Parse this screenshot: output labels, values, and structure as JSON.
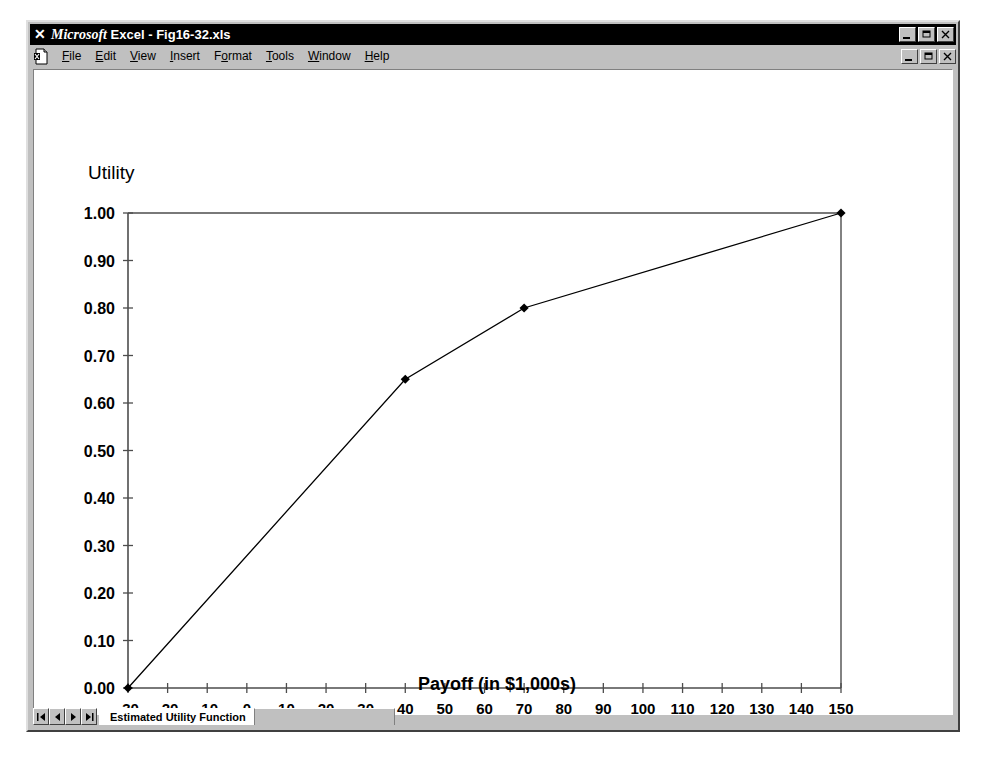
{
  "window": {
    "title_prefix": "Microsoft",
    "title_rest": " Excel - Fig16-32.xls",
    "app_icon": "excel-x-icon",
    "buttons": [
      {
        "name": "minimize",
        "glyph": "minimize-icon"
      },
      {
        "name": "restore",
        "glyph": "restore-icon"
      },
      {
        "name": "close",
        "glyph": "close-icon"
      }
    ]
  },
  "menu": {
    "doc_icon": "excel-document-icon",
    "items": [
      {
        "pre": "",
        "key": "F",
        "post": "ile"
      },
      {
        "pre": "",
        "key": "E",
        "post": "dit"
      },
      {
        "pre": "",
        "key": "V",
        "post": "iew"
      },
      {
        "pre": "",
        "key": "I",
        "post": "nsert"
      },
      {
        "pre": "F",
        "key": "o",
        "post": "rmat"
      },
      {
        "pre": "",
        "key": "T",
        "post": "ools"
      },
      {
        "pre": "",
        "key": "W",
        "post": "indow"
      },
      {
        "pre": "",
        "key": "H",
        "post": "elp"
      }
    ],
    "buttons": [
      {
        "name": "minimize-workbook",
        "glyph": "minimize-icon"
      },
      {
        "name": "restore-workbook",
        "glyph": "restore-icon"
      },
      {
        "name": "close-workbook",
        "glyph": "close-icon"
      }
    ]
  },
  "tab_bar": {
    "nav_buttons": [
      {
        "name": "first-sheet",
        "glyph": "first-icon"
      },
      {
        "name": "previous-sheet",
        "glyph": "previous-icon"
      },
      {
        "name": "next-sheet",
        "glyph": "next-icon"
      },
      {
        "name": "last-sheet",
        "glyph": "last-icon"
      }
    ],
    "sheets": [
      {
        "label": "Estimated Utility Function",
        "active": true
      }
    ]
  },
  "chart_data": {
    "type": "line",
    "title": "",
    "xlabel": "Payoff (in $1,000s)",
    "ylabel": "Utility",
    "xlim": [
      -30,
      150
    ],
    "ylim": [
      0.0,
      1.0
    ],
    "xticks": [
      -30,
      -20,
      -10,
      0,
      10,
      20,
      30,
      40,
      50,
      60,
      70,
      80,
      90,
      100,
      110,
      120,
      130,
      140,
      150
    ],
    "xtick_labels": [
      "-30",
      "-20",
      "-10",
      "0",
      "10",
      "20",
      "30",
      "40",
      "50",
      "60",
      "70",
      "80",
      "90",
      "100",
      "110",
      "120",
      "130",
      "140",
      "150"
    ],
    "yticks": [
      0.0,
      0.1,
      0.2,
      0.3,
      0.4,
      0.5,
      0.6,
      0.7,
      0.8,
      0.9,
      1.0
    ],
    "ytick_labels": [
      "0.00",
      "0.10",
      "0.20",
      "0.30",
      "0.40",
      "0.50",
      "0.60",
      "0.70",
      "0.80",
      "0.90",
      "1.00"
    ],
    "grid": false,
    "legend": false,
    "marker": "diamond",
    "line_color": "#000000",
    "series": [
      {
        "name": "Estimated Utility Function",
        "x": [
          -30,
          40,
          70,
          150
        ],
        "y": [
          0.0,
          0.65,
          0.8,
          1.0
        ]
      }
    ]
  }
}
